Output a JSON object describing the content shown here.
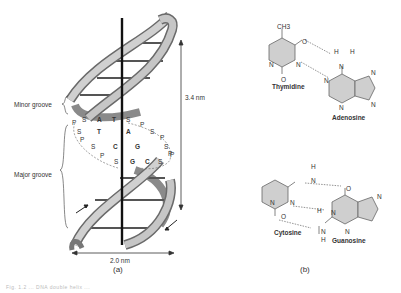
{
  "figure": {
    "panel_a": {
      "label": "(a)",
      "grooves": {
        "minor": "Minor groove",
        "major": "Major groove"
      },
      "dimensions": {
        "pitch": "3.4 nm",
        "diameter": "2.0 nm"
      },
      "backbone_rows": [
        {
          "left": [
            "P",
            "S"
          ],
          "pair": [
            "A",
            "T"
          ],
          "bond": "double",
          "right": [
            "S",
            "P"
          ]
        },
        {
          "left": [
            "S"
          ],
          "pair": [
            "T",
            "A"
          ],
          "bond": "double",
          "right": [
            "S",
            "P"
          ]
        },
        {
          "left": [
            "P",
            "S"
          ],
          "pair": [
            "C",
            "G"
          ],
          "bond": "triple",
          "right": [
            "S",
            "P"
          ]
        },
        {
          "left": [
            "P",
            "S"
          ],
          "pair": [
            "G",
            "C"
          ],
          "bond": "triple",
          "right": [
            "S",
            "P"
          ]
        }
      ],
      "colors": {
        "ribbon_light": "#c8c8c8",
        "ribbon_dark": "#8a8a8a",
        "axis": "#111111",
        "rungs": "#555555"
      }
    },
    "panel_b": {
      "label": "(b)",
      "pairs": [
        {
          "left": {
            "name": "Thymidine",
            "substituent": "CH3",
            "atoms": [
              "O",
              "N",
              "N",
              "O"
            ]
          },
          "right": {
            "name": "Adenosine",
            "atoms": [
              "N",
              "H",
              "H",
              "N",
              "N",
              "N",
              "N"
            ]
          },
          "hydrogen_bonds": 2
        },
        {
          "left": {
            "name": "Cytosine",
            "atoms": [
              "H",
              "N",
              "N",
              "N",
              "O"
            ]
          },
          "right": {
            "name": "Guanosine",
            "atoms": [
              "O",
              "N",
              "H",
              "N",
              "N",
              "N",
              "H"
            ]
          },
          "hydrogen_bonds": 3
        }
      ],
      "colors": {
        "ring_fill": "#cfcfcf",
        "ring_stroke": "#666666",
        "hbond": "#777777"
      }
    },
    "caption_fragment": "Fig. 1.2 ... DNA double helix ..."
  }
}
